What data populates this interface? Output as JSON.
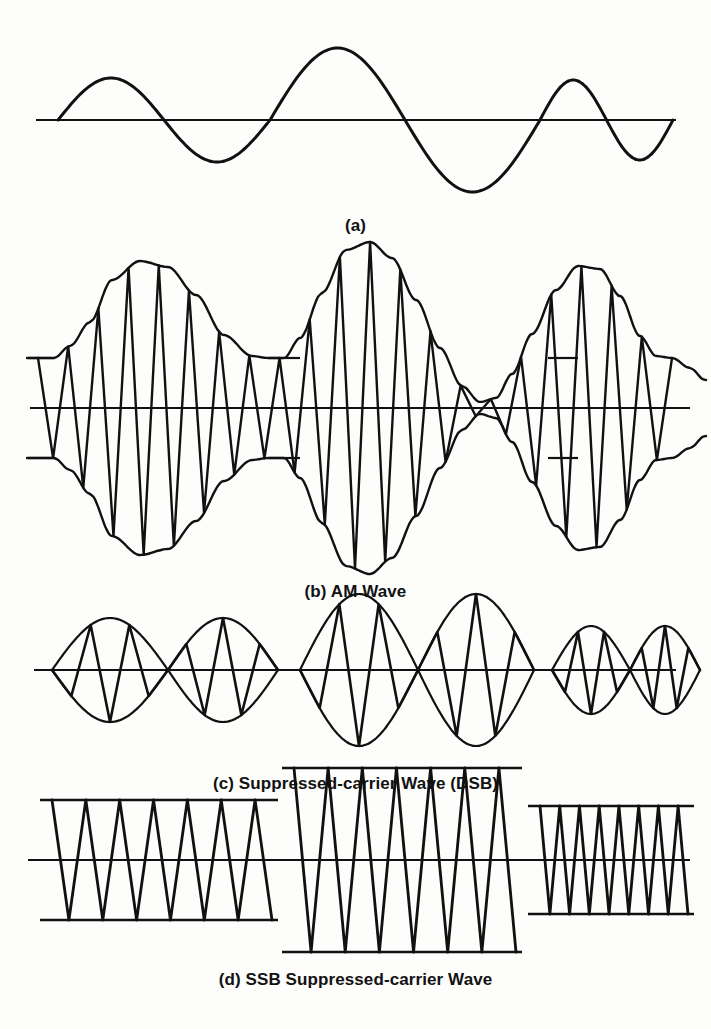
{
  "figure": {
    "background_color": "#fdfdfc",
    "ink_color": "#111111",
    "width": 711,
    "height": 1029
  },
  "panels": [
    {
      "id": "a",
      "caption": "(a)",
      "name": "modulating-signal",
      "description": "Modulating baseband signal: three sine cycles of differing amplitude"
    },
    {
      "id": "b",
      "caption": "(b) AM  Wave",
      "name": "am-wave",
      "description": "Full-carrier amplitude modulated wave with upper and lower envelope"
    },
    {
      "id": "c",
      "caption": "(c) Suppressed-carrier Wave (DSB)",
      "name": "dsb-wave",
      "description": "Double-sideband suppressed carrier wave; envelope pinches to zero with phase reversals"
    },
    {
      "id": "d",
      "caption": "(d) SSB Suppressed-carrier Wave",
      "name": "ssb-wave",
      "description": "Single-sideband suppressed carrier: constant-amplitude bursts whose frequency and level follow the modulation"
    }
  ],
  "chart_data": {
    "type": "line",
    "xlabel": "",
    "ylabel": "",
    "grid": false,
    "legend": "none",
    "charts": [
      {
        "id": "a",
        "label": "(a)",
        "kind": "modulating-signal",
        "baseline_y": 124,
        "x_start": 58,
        "x_end": 673,
        "axis_x_start": 36,
        "axis_x_end": 676,
        "cycles": [
          {
            "start": 58,
            "end": 270,
            "amplitude": 42
          },
          {
            "start": 270,
            "end": 540,
            "amplitude": 72
          },
          {
            "start": 540,
            "end": 673,
            "amplitude": 40
          }
        ],
        "ylim": [
          -80,
          80
        ]
      },
      {
        "id": "b",
        "label": "(b) AM  Wave",
        "kind": "am-wave",
        "baseline_y": 418,
        "x_start": 38,
        "x_end": 672,
        "carrier_level": 50,
        "carrier_cycles": 21,
        "envelope_overshoot": 1.0,
        "stub_width": 16,
        "envelope_points_top": [
          [
            38,
            50
          ],
          [
            54,
            50
          ],
          [
            70,
            62
          ],
          [
            90,
            86
          ],
          [
            112,
            128
          ],
          [
            140,
            147
          ],
          [
            168,
            141
          ],
          [
            196,
            113
          ],
          [
            224,
            73
          ],
          [
            252,
            52
          ],
          [
            268,
            50
          ],
          [
            284,
            50
          ],
          [
            300,
            70
          ],
          [
            322,
            115
          ],
          [
            346,
            158
          ],
          [
            370,
            166
          ],
          [
            392,
            150
          ],
          [
            416,
            108
          ],
          [
            440,
            60
          ],
          [
            462,
            22
          ],
          [
            480,
            6
          ],
          [
            496,
            10
          ],
          [
            512,
            34
          ],
          [
            532,
            74
          ],
          [
            556,
            118
          ],
          [
            578,
            142
          ],
          [
            600,
            139
          ],
          [
            620,
            112
          ],
          [
            640,
            72
          ],
          [
            656,
            52
          ],
          [
            672,
            50
          ],
          [
            690,
            40
          ],
          [
            705,
            28
          ]
        ],
        "ylim": [
          -175,
          175
        ]
      },
      {
        "id": "c",
        "label": "(c) Suppressed-carrier Wave (DSB)",
        "kind": "dsb-wave",
        "baseline_y": 680,
        "axis_x_start": 34,
        "axis_x_end": 676,
        "lobes": [
          {
            "start": 52,
            "end": 168,
            "amplitude": 52,
            "cycles": 3
          },
          {
            "start": 168,
            "end": 278,
            "amplitude": 52,
            "cycles": 3
          },
          {
            "start": 300,
            "end": 418,
            "amplitude": 76,
            "cycles": 3
          },
          {
            "start": 418,
            "end": 534,
            "amplitude": 76,
            "cycles": 3
          },
          {
            "start": 552,
            "end": 630,
            "amplitude": 44,
            "cycles": 3
          },
          {
            "start": 630,
            "end": 700,
            "amplitude": 44,
            "cycles": 3
          }
        ],
        "ylim": [
          -90,
          90
        ]
      },
      {
        "id": "d",
        "label": "(d) SSB Suppressed-carrier Wave",
        "kind": "ssb-wave",
        "baseline_y": 870,
        "axis_x_start": 28,
        "axis_x_end": 690,
        "bursts": [
          {
            "start": 52,
            "end": 272,
            "amplitude": 60,
            "cycles": 6.5
          },
          {
            "start": 294,
            "end": 516,
            "amplitude": 92,
            "cycles": 6.5
          },
          {
            "start": 540,
            "end": 688,
            "amplitude": 54,
            "cycles": 7.5
          }
        ],
        "ylim": [
          -110,
          110
        ]
      }
    ]
  }
}
